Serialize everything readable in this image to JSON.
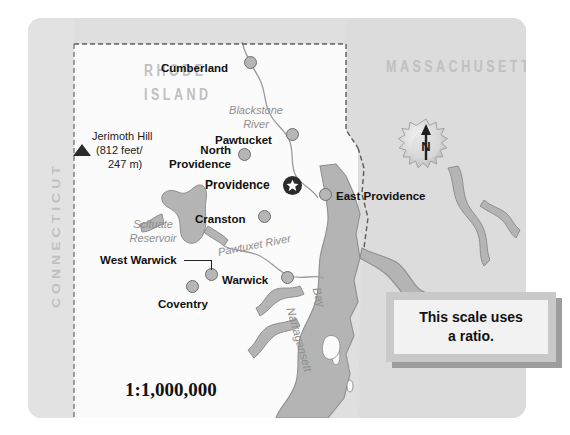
{
  "map": {
    "title": "Rhode Island reference map",
    "scale_ratio": "1:1,000,000",
    "states": [
      {
        "name": "RHODE ISLAND",
        "line1": "RHODE",
        "line2": "ISLAND"
      },
      {
        "name": "MASSACHUSETTS"
      },
      {
        "name": "CONNECTICUT"
      }
    ],
    "capital": {
      "name": "Providence",
      "marker": "star-in-circle"
    },
    "cities": [
      {
        "name": "Cumberland",
        "label_align": "right"
      },
      {
        "name": "Pawtucket",
        "label_align": "right"
      },
      {
        "name": "North Providence",
        "line1": "North",
        "line2": "Providence",
        "label_align": "right"
      },
      {
        "name": "East Providence",
        "label_align": "left"
      },
      {
        "name": "Cranston",
        "label_align": "right"
      },
      {
        "name": "West Warwick",
        "label_align": "right",
        "has_leader": true
      },
      {
        "name": "Warwick",
        "label_align": "right"
      },
      {
        "name": "Coventry",
        "label_align": "center"
      }
    ],
    "water_features": [
      {
        "name": "Blackstone River",
        "line1": "Blackstone",
        "line2": "River"
      },
      {
        "name": "Scituate Reservoir",
        "line1": "Scituate",
        "line2": "Reservoir"
      },
      {
        "name": "Pawtuxet River"
      },
      {
        "name": "Narragansett Bay",
        "line1": "Narragansett",
        "line2": "Bay"
      }
    ],
    "high_point": {
      "name": "Jerimoth Hill",
      "line1": "Jerimoth Hill",
      "line2": "(812 feet/",
      "line3": "247 m)",
      "elevation_feet": "812 feet",
      "elevation_meters": "247 m"
    },
    "compass": {
      "north_label": "N"
    }
  },
  "callout": {
    "line1": "This scale uses",
    "line2": "a ratio."
  },
  "colors": {
    "page_background": "#ffffff",
    "paper": "#e4e4e4",
    "land_other_state": "#dcdcdc",
    "land_rhode_island": "#fbfbfb",
    "water": "#b4b4b4",
    "city_dot_fill": "#b6b6b6",
    "city_dot_stroke": "#6d6d6d",
    "capital_marker": "#2a2a2a",
    "state_label": "#c0c0c0",
    "water_label": "#8e8e8e",
    "city_label": "#111111",
    "callout_frame": "#c9c9c9",
    "callout_fill": "#f2f2f2",
    "callout_shadow": "#9d9d9d"
  }
}
